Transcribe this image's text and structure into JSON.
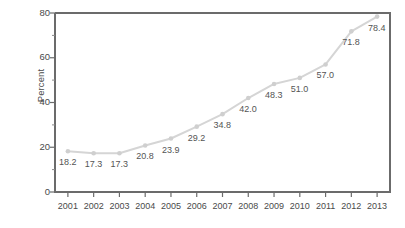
{
  "chart_data": {
    "type": "line",
    "title": "",
    "subtitle": "",
    "xlabel": "",
    "ylabel": "Percent",
    "categories": [
      "2001",
      "2002",
      "2003",
      "2004",
      "2005",
      "2006",
      "2007",
      "2008",
      "2009",
      "2010",
      "2011",
      "2012",
      "2013"
    ],
    "values": [
      18.2,
      17.3,
      17.3,
      20.8,
      23.9,
      29.2,
      34.8,
      42.0,
      48.3,
      51.0,
      57.0,
      71.8,
      78.4
    ],
    "point_labels": [
      "18.2",
      "17.3",
      "17.3",
      "20.8",
      "23.9",
      "29.2",
      "34.8",
      "42.0",
      "48.3",
      "51.0",
      "57.0",
      "71.8",
      "78.4"
    ],
    "ylim": [
      0,
      80
    ],
    "yticks": [
      0,
      20,
      40,
      60,
      80
    ],
    "ytick_labels": [
      "0",
      "20",
      "40",
      "60",
      "80"
    ],
    "y_minor_ticks": [
      10,
      30,
      50,
      70
    ],
    "xtick_labels": [
      "2001",
      "2002",
      "2003",
      "2004",
      "2005",
      "2006",
      "2007",
      "2008",
      "2009",
      "2010",
      "2011",
      "2012",
      "2013"
    ],
    "grid": false,
    "legend": null,
    "legend_position": "none",
    "series": [
      {
        "name": "Percent",
        "values": [
          18.2,
          17.3,
          17.3,
          20.8,
          23.9,
          29.2,
          34.8,
          42.0,
          48.3,
          51.0,
          57.0,
          71.8,
          78.4
        ]
      }
    ],
    "colors": {
      "line": "#d5d5d5",
      "marker": "#cfcfcf",
      "axis": "#6b6b6b",
      "tick_text": "#4a4a4a",
      "label_text": "#545454",
      "background": "#ffffff"
    }
  }
}
